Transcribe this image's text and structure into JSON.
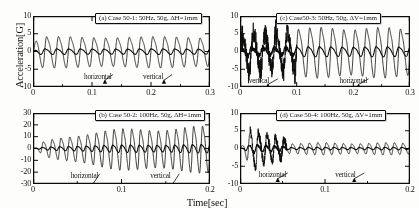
{
  "figure": {
    "ylabel": "Acceleration[G]",
    "xlabel": "Time[sec]",
    "trace_labels": {
      "horizontal": "horizontal",
      "vertical": "vertical"
    },
    "colors": {
      "ink": "#111111",
      "paper": "#fdfdfc",
      "axis": "#3a3a3a"
    }
  },
  "chart_data": [
    {
      "type": "line",
      "panel": "a",
      "title": "(a) Case 50-1: 50Hz, 50g,   ΔH=1mm",
      "xlabel": "Time[sec]",
      "ylabel": "Acceleration[G]",
      "xlim": [
        0,
        0.3
      ],
      "ylim": [
        -10,
        10
      ],
      "xticks": [
        0,
        0.1,
        0.2,
        0.3
      ],
      "xticklabels": [
        "0",
        "0.1",
        "0.2",
        "0.3"
      ],
      "yticks": [
        -10,
        -5,
        0,
        5,
        10
      ],
      "yticklabels": [
        "-10",
        "-5",
        "0",
        "5",
        "10"
      ],
      "grid": false,
      "legend": "inline-annotation",
      "annotations": [
        {
          "text": "horizontal",
          "x": 0.105,
          "y": -7.2
        },
        {
          "text": "vertical",
          "x": 0.205,
          "y": -7.2
        }
      ],
      "series": [
        {
          "name": "horizontal",
          "frequency_hz": 50,
          "amplitude": 5.0,
          "envelope": "steady",
          "linewidth": 0.8
        },
        {
          "name": "vertical",
          "frequency_hz": 50,
          "amplitude": 0.9,
          "envelope": "steady",
          "linewidth": 1.1
        }
      ]
    },
    {
      "type": "line",
      "panel": "b",
      "title": "(b) Case 50-2: 100Hz, 50g,   ΔH=1mm",
      "xlabel": "Time[sec]",
      "ylabel": "Acceleration[G]",
      "xlim": [
        0,
        0.2
      ],
      "ylim": [
        -30,
        30
      ],
      "xticks": [
        0,
        0.1,
        0.2
      ],
      "xticklabels": [
        "0",
        "0.1",
        "0.2"
      ],
      "yticks": [
        -30,
        -20,
        -10,
        0,
        10,
        20,
        30
      ],
      "yticklabels": [
        "-30",
        "-20",
        "-10",
        "0",
        "10",
        "20",
        "30"
      ],
      "grid": false,
      "legend": "inline-annotation",
      "annotations": [
        {
          "text": "horizontal",
          "x": 0.055,
          "y": -23.5
        },
        {
          "text": "vertical",
          "x": 0.145,
          "y": -23.5
        }
      ],
      "series": [
        {
          "name": "horizontal",
          "frequency_hz": 100,
          "amplitude": 22.0,
          "envelope": "growing",
          "linewidth": 0.8
        },
        {
          "name": "vertical",
          "frequency_hz": 100,
          "amplitude": 4.0,
          "envelope": "growing",
          "linewidth": 1.1
        }
      ]
    },
    {
      "type": "line",
      "panel": "c",
      "title": "(c) Case50-3: 50Hz, 50g,   ΔV=1mm",
      "xlabel": "Time[sec]",
      "ylabel": "Acceleration[G]",
      "xlim": [
        0,
        0.3
      ],
      "ylim": [
        -10,
        10
      ],
      "xticks": [
        0,
        0.1,
        0.2,
        0.3
      ],
      "xticklabels": [
        "0",
        "0.1",
        "0.2",
        "0.3"
      ],
      "yticks": [
        -10,
        -5,
        0,
        5,
        10
      ],
      "yticklabels": [
        "-10",
        "-5",
        "0",
        "5",
        "10"
      ],
      "grid": false,
      "legend": "inline-annotation",
      "annotations": [
        {
          "text": "vertical",
          "x": 0.035,
          "y": -8.4
        },
        {
          "text": "horizontal",
          "x": 0.195,
          "y": -8.4
        }
      ],
      "series": [
        {
          "name": "horizontal",
          "frequency_hz": 50,
          "amplitude": 8.0,
          "envelope": "irregular-then-steady",
          "linewidth": 0.8
        },
        {
          "name": "vertical",
          "frequency_hz": 50,
          "amplitude": 1.6,
          "envelope": "irregular-then-steady",
          "linewidth": 1.1
        }
      ]
    },
    {
      "type": "line",
      "panel": "d",
      "title": "(d) Case 50-4: 100Hz, 50g,   ΔV=1mm",
      "xlabel": "Time[sec]",
      "ylabel": "Acceleration[G]",
      "xlim": [
        0,
        0.2
      ],
      "ylim": [
        -10,
        10
      ],
      "xticks": [
        0,
        0.1,
        0.2
      ],
      "xticklabels": [
        "0",
        "0.1",
        "0.2"
      ],
      "yticks": [
        -10,
        -5,
        0,
        5,
        10
      ],
      "yticklabels": [
        "-10",
        "-5",
        "0",
        "5",
        "10"
      ],
      "grid": false,
      "legend": "inline-annotation",
      "annotations": [
        {
          "text": "horizontal",
          "x": 0.035,
          "y": -7.6
        },
        {
          "text": "vertical",
          "x": 0.125,
          "y": -7.6
        }
      ],
      "series": [
        {
          "name": "horizontal",
          "frequency_hz": 100,
          "amplitude": 5.5,
          "envelope": "decaying",
          "linewidth": 0.8
        },
        {
          "name": "vertical",
          "frequency_hz": 100,
          "amplitude": 1.2,
          "envelope": "decaying",
          "linewidth": 1.1
        }
      ]
    }
  ]
}
